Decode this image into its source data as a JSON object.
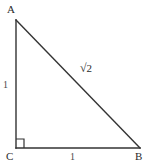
{
  "figure": {
    "type": "right-triangle-geometry-diagram",
    "background_color": "#ffffff",
    "stroke_color": "#333333",
    "stroke_width": 1.4
  },
  "vertices": {
    "a": {
      "label": "A",
      "x": 16,
      "y": 20
    },
    "c": {
      "label": "C",
      "x": 16,
      "y": 148
    },
    "b": {
      "label": "B",
      "x": 140,
      "y": 148
    }
  },
  "sides": {
    "leg_vertical": {
      "label": "1",
      "from": "A",
      "to": "C"
    },
    "leg_horizontal": {
      "label": "1",
      "from": "C",
      "to": "B"
    },
    "hypotenuse": {
      "radical_sign": "√",
      "radicand": "2",
      "label": "√2",
      "from": "A",
      "to": "B"
    }
  },
  "right_angle_marker": {
    "at_vertex": "C",
    "size": 8,
    "label": "right-angle"
  }
}
